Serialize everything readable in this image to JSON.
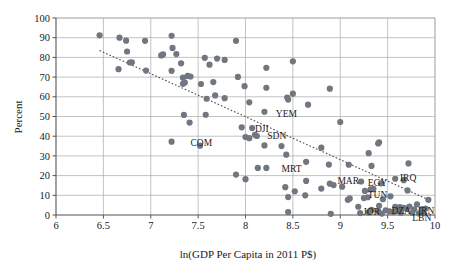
{
  "chart_data": {
    "type": "scatter",
    "title": "",
    "xlabel": "ln(GDP Per Capita in 2011 P$)",
    "ylabel": "Percent",
    "xlim": [
      6,
      10
    ],
    "ylim": [
      0,
      100
    ],
    "xticks": [
      "6",
      "6.5",
      "7",
      "7.5",
      "8",
      "8.5",
      "9",
      "9.5",
      "10"
    ],
    "xtick_values": [
      6,
      6.5,
      7,
      7.5,
      8,
      8.5,
      9,
      9.5,
      10
    ],
    "yticks": [
      "0",
      "10",
      "20",
      "30",
      "40",
      "50",
      "60",
      "70",
      "80",
      "90",
      "100"
    ],
    "ytick_values": [
      0,
      10,
      20,
      30,
      40,
      50,
      60,
      70,
      80,
      90,
      100
    ],
    "grid": "horizontal-and-vertical",
    "legend": "none",
    "marker_color": "#707780",
    "gridline_color": "#a9a9a9",
    "trendline": {
      "style": "dotted",
      "color": "#4a4a4a",
      "x0": 6.46,
      "y0": 83.5,
      "x1": 9.93,
      "y1": 7.8
    },
    "points": [
      {
        "x": 6.46,
        "y": 91.2
      },
      {
        "x": 6.67,
        "y": 90.0
      },
      {
        "x": 6.74,
        "y": 88.5
      },
      {
        "x": 6.94,
        "y": 88.4
      },
      {
        "x": 7.22,
        "y": 91.0
      },
      {
        "x": 7.9,
        "y": 88.4
      },
      {
        "x": 6.75,
        "y": 83.0
      },
      {
        "x": 7.23,
        "y": 84.8
      },
      {
        "x": 7.11,
        "y": 81.0
      },
      {
        "x": 7.13,
        "y": 81.5
      },
      {
        "x": 7.27,
        "y": 81.7
      },
      {
        "x": 7.57,
        "y": 79.8
      },
      {
        "x": 7.7,
        "y": 79.4
      },
      {
        "x": 7.78,
        "y": 78.7
      },
      {
        "x": 8.5,
        "y": 78.0
      },
      {
        "x": 6.8,
        "y": 77.5
      },
      {
        "x": 6.78,
        "y": 77.4
      },
      {
        "x": 7.32,
        "y": 77.0
      },
      {
        "x": 7.62,
        "y": 76.3
      },
      {
        "x": 8.22,
        "y": 74.7
      },
      {
        "x": 6.66,
        "y": 74.0
      },
      {
        "x": 6.95,
        "y": 73.3
      },
      {
        "x": 7.22,
        "y": 73.2
      },
      {
        "x": 7.34,
        "y": 69.7
      },
      {
        "x": 7.39,
        "y": 70.6
      },
      {
        "x": 7.42,
        "y": 70.3
      },
      {
        "x": 7.92,
        "y": 70.1
      },
      {
        "x": 7.34,
        "y": 66.6
      },
      {
        "x": 7.36,
        "y": 67.2
      },
      {
        "x": 7.53,
        "y": 66.5
      },
      {
        "x": 7.66,
        "y": 67.5
      },
      {
        "x": 7.99,
        "y": 65.4
      },
      {
        "x": 8.22,
        "y": 64.6
      },
      {
        "x": 8.89,
        "y": 64.1
      },
      {
        "x": 8.5,
        "y": 61.6
      },
      {
        "x": 8.44,
        "y": 59.6
      },
      {
        "x": 8.45,
        "y": 58.6
      },
      {
        "x": 7.59,
        "y": 59.0
      },
      {
        "x": 7.78,
        "y": 59.3
      },
      {
        "x": 7.68,
        "y": 60.7
      },
      {
        "x": 8.04,
        "y": 57.2
      },
      {
        "x": 8.66,
        "y": 56.0
      },
      {
        "x": 8.2,
        "y": 52.4
      },
      {
        "x": 7.35,
        "y": 50.8
      },
      {
        "x": 7.58,
        "y": 50.9
      },
      {
        "x": 7.41,
        "y": 46.9
      },
      {
        "x": 9.0,
        "y": 47.2
      },
      {
        "x": 7.96,
        "y": 44.5
      },
      {
        "x": 8.07,
        "y": 44.1
      },
      {
        "x": 8.1,
        "y": 40.7
      },
      {
        "x": 8.0,
        "y": 39.6
      },
      {
        "x": 8.04,
        "y": 39.0
      },
      {
        "x": 8.12,
        "y": 40.1
      },
      {
        "x": 7.22,
        "y": 37.2
      },
      {
        "x": 7.52,
        "y": 35.2
      },
      {
        "x": 8.2,
        "y": 35.3
      },
      {
        "x": 8.38,
        "y": 35.0
      },
      {
        "x": 9.41,
        "y": 36.9
      },
      {
        "x": 9.4,
        "y": 36.3
      },
      {
        "x": 8.8,
        "y": 34.2
      },
      {
        "x": 9.3,
        "y": 31.4
      },
      {
        "x": 8.43,
        "y": 30.6
      },
      {
        "x": 8.64,
        "y": 27.0
      },
      {
        "x": 9.72,
        "y": 26.2
      },
      {
        "x": 8.88,
        "y": 25.6
      },
      {
        "x": 9.09,
        "y": 25.5
      },
      {
        "x": 9.33,
        "y": 24.9
      },
      {
        "x": 8.13,
        "y": 23.9
      },
      {
        "x": 8.22,
        "y": 23.9
      },
      {
        "x": 7.9,
        "y": 20.5
      },
      {
        "x": 8.0,
        "y": 18.2
      },
      {
        "x": 9.58,
        "y": 18.4
      },
      {
        "x": 9.67,
        "y": 17.7
      },
      {
        "x": 9.22,
        "y": 17.0
      },
      {
        "x": 8.64,
        "y": 17.3
      },
      {
        "x": 9.43,
        "y": 16.1
      },
      {
        "x": 8.89,
        "y": 15.9
      },
      {
        "x": 8.93,
        "y": 15.2
      },
      {
        "x": 9.02,
        "y": 14.4
      },
      {
        "x": 8.42,
        "y": 14.1
      },
      {
        "x": 8.52,
        "y": 12.0
      },
      {
        "x": 8.8,
        "y": 13.4
      },
      {
        "x": 9.26,
        "y": 12.2
      },
      {
        "x": 9.32,
        "y": 13.0
      },
      {
        "x": 9.35,
        "y": 13.3
      },
      {
        "x": 9.71,
        "y": 12.5
      },
      {
        "x": 8.63,
        "y": 10.0
      },
      {
        "x": 8.45,
        "y": 9.1
      },
      {
        "x": 9.1,
        "y": 8.4
      },
      {
        "x": 9.08,
        "y": 7.7
      },
      {
        "x": 9.25,
        "y": 8.6
      },
      {
        "x": 9.29,
        "y": 9.0
      },
      {
        "x": 9.45,
        "y": 8.0
      },
      {
        "x": 9.53,
        "y": 9.5
      },
      {
        "x": 9.93,
        "y": 7.7
      },
      {
        "x": 9.81,
        "y": 5.4
      },
      {
        "x": 9.19,
        "y": 4.2
      },
      {
        "x": 9.41,
        "y": 4.7
      },
      {
        "x": 9.58,
        "y": 4.2
      },
      {
        "x": 9.63,
        "y": 4.0
      },
      {
        "x": 9.67,
        "y": 3.6
      },
      {
        "x": 9.7,
        "y": 3.2
      },
      {
        "x": 9.73,
        "y": 4.3
      },
      {
        "x": 9.78,
        "y": 2.9
      },
      {
        "x": 9.86,
        "y": 3.0
      },
      {
        "x": 9.9,
        "y": 3.3
      },
      {
        "x": 9.33,
        "y": 2.6
      },
      {
        "x": 9.4,
        "y": 2.0
      },
      {
        "x": 9.48,
        "y": 2.4
      },
      {
        "x": 9.52,
        "y": 1.8
      },
      {
        "x": 9.56,
        "y": 1.5
      },
      {
        "x": 9.6,
        "y": 2.2
      },
      {
        "x": 9.64,
        "y": 1.2
      },
      {
        "x": 9.76,
        "y": 1.1
      },
      {
        "x": 9.83,
        "y": 0.8
      },
      {
        "x": 9.88,
        "y": 0.9
      },
      {
        "x": 8.45,
        "y": 1.5
      },
      {
        "x": 8.9,
        "y": 0.6
      },
      {
        "x": 9.21,
        "y": 1.0
      },
      {
        "x": 9.3,
        "y": 1.3
      },
      {
        "x": 9.44,
        "y": 0.7
      }
    ],
    "annotations": [
      {
        "label": "YEM",
        "x": 8.32,
        "y": 51.5
      },
      {
        "label": "DJI",
        "x": 8.1,
        "y": 44.1
      },
      {
        "label": "SDN",
        "x": 8.23,
        "y": 40.2
      },
      {
        "label": "COM",
        "x": 7.42,
        "y": 36.8
      },
      {
        "label": "MRT",
        "x": 8.38,
        "y": 23.7
      },
      {
        "label": "MAR",
        "x": 8.97,
        "y": 17.5
      },
      {
        "label": "EGY",
        "x": 9.29,
        "y": 16.3
      },
      {
        "label": "IRQ",
        "x": 9.63,
        "y": 18.9
      },
      {
        "label": "TUN",
        "x": 9.29,
        "y": 10.5
      },
      {
        "label": "JOR",
        "x": 9.24,
        "y": 1.6
      },
      {
        "label": "DZA",
        "x": 9.54,
        "y": 2.2
      },
      {
        "label": "IRN",
        "x": 9.82,
        "y": 2.4
      },
      {
        "label": "LBN",
        "x": 9.76,
        "y": -1.1
      }
    ]
  }
}
